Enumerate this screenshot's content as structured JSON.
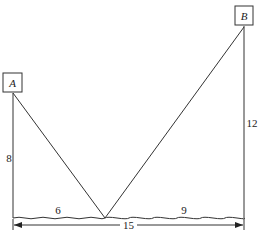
{
  "diagram": {
    "type": "geometry-reflection-problem",
    "points": {
      "A": {
        "label": "A",
        "height": "8"
      },
      "B": {
        "label": "B",
        "height": "12"
      }
    },
    "ground": {
      "left_segment": "6",
      "right_segment": "9",
      "total_width": "15"
    },
    "colors": {
      "line": "#333333",
      "background": "#ffffff"
    }
  }
}
